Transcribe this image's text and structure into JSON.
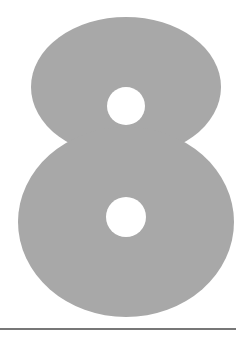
{
  "figure": {
    "glyph": "8",
    "alt_label": "Digit eight",
    "colors": {
      "background": "#ffffff",
      "glyph_fill": "#a8a8a8",
      "hole_fill": "#ffffff",
      "rule": "#4a4a4a"
    },
    "geometry": {
      "upper_lobe": {
        "cx": 126,
        "cy": 87,
        "rx": 95,
        "ry": 70
      },
      "lower_lobe": {
        "cx": 126,
        "cy": 222,
        "rx": 108,
        "ry": 95
      },
      "upper_hole": {
        "cx": 126,
        "cy": 106,
        "r": 19
      },
      "lower_hole": {
        "cx": 126,
        "cy": 217,
        "r": 20
      },
      "rule": {
        "x1": 0,
        "x2": 236,
        "y": 329,
        "width": 1.5
      }
    }
  }
}
